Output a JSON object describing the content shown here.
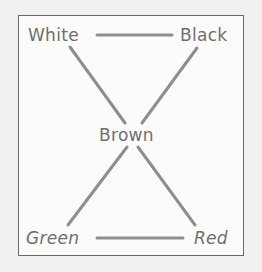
{
  "diagram": {
    "type": "node-link",
    "nodes": [
      {
        "id": "white",
        "label": "White",
        "position": "top-left"
      },
      {
        "id": "black",
        "label": "Black",
        "position": "top-right"
      },
      {
        "id": "brown",
        "label": "Brown",
        "position": "center"
      },
      {
        "id": "green",
        "label": "Green",
        "position": "bottom-left"
      },
      {
        "id": "red",
        "label": "Red",
        "position": "bottom-right"
      }
    ],
    "edges": [
      {
        "from": "white",
        "to": "black"
      },
      {
        "from": "white",
        "to": "brown"
      },
      {
        "from": "black",
        "to": "brown"
      },
      {
        "from": "brown",
        "to": "green"
      },
      {
        "from": "brown",
        "to": "red"
      },
      {
        "from": "green",
        "to": "red"
      }
    ]
  },
  "labels": {
    "white": "White",
    "black": "Black",
    "brown": "Brown",
    "green": "Green",
    "red": "Red"
  },
  "colors": {
    "background": "#f1f1f0",
    "frame_fill": "#fbfbfa",
    "frame_border": "#6a6a6a",
    "line": "#8e8e8e",
    "text": "#6f6f6f"
  }
}
